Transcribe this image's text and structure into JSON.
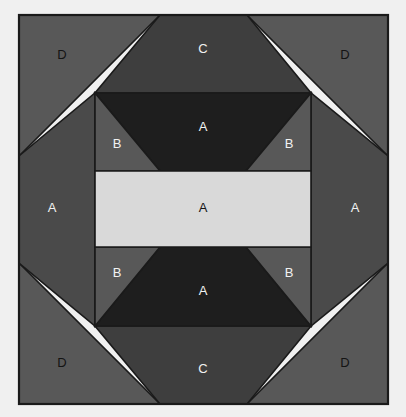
{
  "figure": {
    "canvas": {
      "width": 406,
      "height": 417
    },
    "background_color": "#f0f0f0",
    "block_outline_color": "#1a1a1a"
  },
  "palette": {
    "background": "#f0f0f0",
    "outline": "#1a1a1a",
    "fabric_very_dark": "#1e1e1e",
    "fabric_dark": "#3e3e3e",
    "fabric_medium_dark": "#4a4a4a",
    "fabric_medium": "#585858",
    "fabric_white": "#d9d9d9",
    "label_light": "#f2f2f2",
    "label_dark": "#141414"
  },
  "patches": [
    {
      "id": "corner-top-left",
      "label": "D",
      "fabric": "fabric_medium",
      "color": "#585858",
      "label_color": "label_dark",
      "label_x": 62,
      "label_y": 56,
      "points": "19,15 160,15 19,156"
    },
    {
      "id": "corner-top-right",
      "label": "D",
      "fabric": "fabric_medium",
      "color": "#585858",
      "label_color": "label_dark",
      "label_x": 345,
      "label_y": 56,
      "points": "247,15 388,15 388,156"
    },
    {
      "id": "corner-bottom-left",
      "label": "D",
      "fabric": "fabric_medium",
      "color": "#585858",
      "label_color": "label_dark",
      "label_x": 62,
      "label_y": 364,
      "points": "19,263 19,404 160,404"
    },
    {
      "id": "corner-bottom-right",
      "label": "D",
      "fabric": "fabric_medium",
      "color": "#585858",
      "label_color": "label_dark",
      "label_x": 345,
      "label_y": 364,
      "points": "388,263 388,404 247,404"
    },
    {
      "id": "triangle-top",
      "label": "C",
      "fabric": "fabric_dark",
      "color": "#3e3e3e",
      "label_color": "label_light",
      "label_x": 203,
      "label_y": 50,
      "points": "160,15 247,15 311,93 95,93"
    },
    {
      "id": "triangle-bottom",
      "label": "C",
      "fabric": "fabric_dark",
      "color": "#3e3e3e",
      "label_color": "label_light",
      "label_x": 203,
      "label_y": 370,
      "points": "95,326 311,326 247,404 160,404"
    },
    {
      "id": "side-left",
      "label": "A",
      "fabric": "fabric_medium_dark",
      "color": "#4a4a4a",
      "label_color": "label_light",
      "label_x": 52,
      "label_y": 209,
      "points": "19,156 95,93 95,326 19,263"
    },
    {
      "id": "side-right",
      "label": "A",
      "fabric": "fabric_medium_dark",
      "color": "#4a4a4a",
      "label_color": "label_light",
      "label_x": 355,
      "label_y": 209,
      "points": "388,156 388,263 311,326 311,93"
    },
    {
      "id": "band-top-background",
      "label": "",
      "fabric": "fabric_medium",
      "color": "#585858",
      "label_color": "label_light",
      "label_x": 0,
      "label_y": 0,
      "points": "95,93 311,93 311,171 95,171"
    },
    {
      "id": "band-bottom-background",
      "label": "",
      "fabric": "fabric_medium",
      "color": "#585858",
      "label_color": "label_light",
      "label_x": 0,
      "label_y": 0,
      "points": "95,247 311,247 311,326 95,326"
    },
    {
      "id": "trapezoid-top",
      "label": "A",
      "fabric": "fabric_very_dark",
      "color": "#1e1e1e",
      "label_color": "label_light",
      "label_x": 203,
      "label_y": 128,
      "points": "95,93 311,93 246,171 160,171"
    },
    {
      "id": "trapezoid-bottom",
      "label": "A",
      "fabric": "fabric_very_dark",
      "color": "#1e1e1e",
      "label_color": "label_light",
      "label_x": 203,
      "label_y": 292,
      "points": "160,247 246,247 311,326 95,326"
    },
    {
      "id": "corner-b-top-left",
      "label": "B",
      "fabric": "fabric_medium",
      "color": "#585858",
      "label_color": "label_light",
      "label_x": 117,
      "label_y": 145,
      "points": "95,93 160,171 95,171"
    },
    {
      "id": "corner-b-top-right",
      "label": "B",
      "fabric": "fabric_medium",
      "color": "#585858",
      "label_color": "label_light",
      "label_x": 289,
      "label_y": 145,
      "points": "311,93 311,171 246,171"
    },
    {
      "id": "corner-b-bottom-left",
      "label": "B",
      "fabric": "fabric_medium",
      "color": "#585858",
      "label_color": "label_light",
      "label_x": 117,
      "label_y": 274,
      "points": "95,247 160,247 95,326"
    },
    {
      "id": "corner-b-bottom-right",
      "label": "B",
      "fabric": "fabric_medium",
      "color": "#585858",
      "label_color": "label_light",
      "label_x": 289,
      "label_y": 274,
      "points": "246,247 311,247 311,326"
    },
    {
      "id": "center-rectangle",
      "label": "A",
      "fabric": "fabric_white",
      "color": "#d9d9d9",
      "label_color": "label_dark",
      "label_x": 203,
      "label_y": 209,
      "points": "95,171 311,171 311,247 95,247"
    }
  ],
  "legend": {
    "fabric_codes": [
      "A",
      "B",
      "C",
      "D"
    ]
  }
}
